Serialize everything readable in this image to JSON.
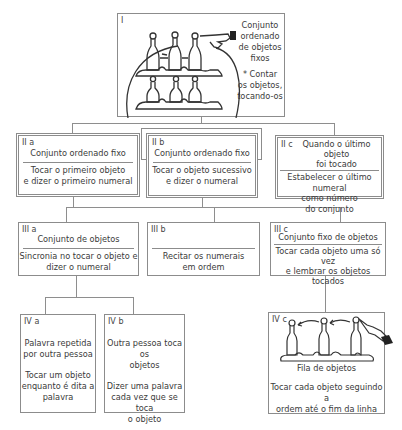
{
  "diagram": {
    "level1": {
      "label": "I",
      "title": "Conjunto\nordenado\nde objetos\nfixos",
      "note": "* Contar\nos objetos,\ntocando-os",
      "illustration": "bottles-on-shelves-with-pointing-hand"
    },
    "level2": [
      {
        "label": "II a",
        "title": "Conjunto ordenado fixo",
        "action": "Tocar o primeiro objeto\ne dizer o primeiro numeral"
      },
      {
        "label": "II b",
        "title": "Conjunto ordenado fixo",
        "action": "Tocar o objeto sucessivo\ne dizer o numeral"
      },
      {
        "label": "II c",
        "title": "Quando o último objeto\nfoi tocado",
        "action": "Estabelecer o último numeral\ncomo número\ndo conjunto"
      }
    ],
    "level3": [
      {
        "label": "III a",
        "title": "Conjunto de objetos",
        "action": "Sincronia no tocar o objeto e\ndizer o numeral"
      },
      {
        "label": "III b",
        "title": "",
        "action": "Recitar os numerais\nem ordem"
      },
      {
        "label": "III c",
        "title": "Conjunto fixo de objetos",
        "action": "Tocar cada objeto uma só vez\ne lembrar os objetos tocados"
      }
    ],
    "level4": [
      {
        "label": "IV a",
        "title": "Palavra repetida\npor outra pessoa",
        "action": "Tocar um objeto\nenquanto é dita a\npalavra"
      },
      {
        "label": "IV b",
        "title": "Outra pessoa toca os\nobjetos",
        "action": "Dizer uma palavra\ncada vez que se toca\no objeto"
      },
      {
        "label": "IV c",
        "title": "Fila de objetos",
        "action": "Tocar cada objeto seguindo a\nordem até o fim da linha",
        "illustration": "row-of-bottles-with-arrows-and-hand"
      }
    ]
  }
}
